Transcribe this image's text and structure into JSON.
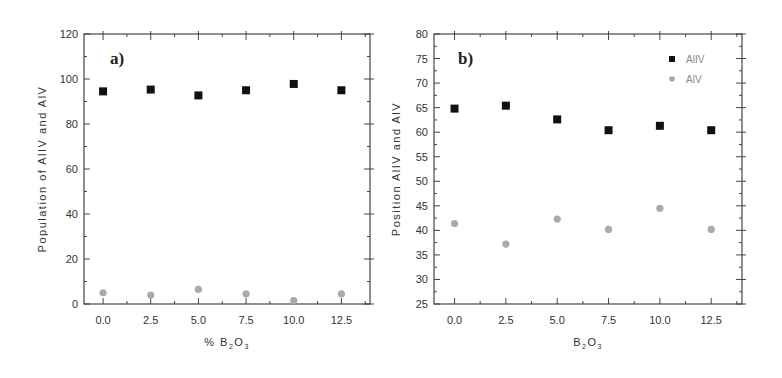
{
  "chart_data": [
    {
      "type": "scatter",
      "panel_label": "a)",
      "title": "",
      "xlabel": "% B2O3",
      "ylabel": "Population of AlIV and AlV",
      "xlim": [
        -1,
        14
      ],
      "ylim": [
        0,
        120
      ],
      "xticks": [
        "0.0",
        "2.5",
        "5.0",
        "7.5",
        "10.0",
        "12.5"
      ],
      "yticks": [
        "0",
        "20",
        "40",
        "60",
        "80",
        "100",
        "120"
      ],
      "x": [
        0.0,
        2.5,
        5.0,
        7.5,
        10.0,
        12.5
      ],
      "series": [
        {
          "name": "AlIV",
          "marker": "square",
          "color": "#111111",
          "values": [
            94.5,
            95.3,
            92.7,
            95.0,
            97.8,
            95.0
          ]
        },
        {
          "name": "AlV",
          "marker": "circle",
          "color": "#aaaaaa",
          "values": [
            5.0,
            4.0,
            6.5,
            4.5,
            1.5,
            4.5
          ]
        }
      ],
      "legend": null,
      "grid": false
    },
    {
      "type": "scatter",
      "panel_label": "b)",
      "title": "",
      "xlabel": "B2O3",
      "ylabel": "Position AlIV and AlV",
      "xlim": [
        -1,
        14
      ],
      "ylim": [
        25,
        80
      ],
      "xticks": [
        "0.0",
        "2.5",
        "5.0",
        "7.5",
        "10.0",
        "12.5"
      ],
      "yticks": [
        "25",
        "30",
        "35",
        "40",
        "45",
        "50",
        "55",
        "60",
        "65",
        "70",
        "75",
        "80"
      ],
      "x": [
        0.0,
        2.5,
        5.0,
        7.5,
        10.0,
        12.5
      ],
      "series": [
        {
          "name": "AlIV",
          "marker": "square",
          "color": "#111111",
          "values": [
            64.8,
            65.4,
            62.6,
            60.4,
            61.3,
            60.4
          ]
        },
        {
          "name": "AlV",
          "marker": "circle",
          "color": "#aaaaaa",
          "values": [
            41.4,
            37.2,
            42.3,
            40.2,
            44.5,
            40.2
          ]
        }
      ],
      "legend": {
        "position": "top-right",
        "entries": [
          "AlIV",
          "AlV"
        ]
      },
      "grid": false
    }
  ]
}
